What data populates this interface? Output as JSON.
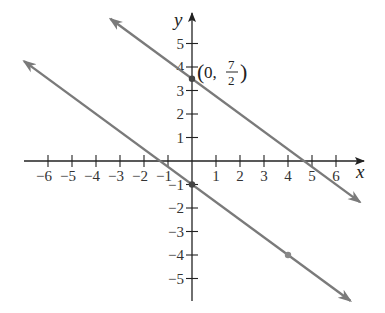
{
  "chart_data": {
    "type": "line",
    "title": "",
    "xlabel": "x",
    "ylabel": "y",
    "xlim": [
      -7,
      7
    ],
    "ylim": [
      -6,
      6
    ],
    "grid": false,
    "x_ticks": [
      -6,
      -5,
      -4,
      -3,
      -2,
      -1,
      1,
      2,
      3,
      4,
      5,
      6
    ],
    "y_ticks": [
      -5,
      -4,
      -3,
      -2,
      -1,
      1,
      2,
      3,
      4,
      5
    ],
    "x_tick_labels": [
      "−6",
      "−5",
      "−4",
      "−3",
      "−2",
      "−1",
      "1",
      "2",
      "3",
      "4",
      "5",
      "6"
    ],
    "y_tick_labels": [
      "−5",
      "−4",
      "−3",
      "−2",
      "−1",
      "1",
      "2",
      "3",
      "4",
      "5"
    ],
    "series": [
      {
        "name": "upper line",
        "equation": "y = -3/4 x + 7/2",
        "slope": -0.75,
        "intercept": 3.5,
        "x": [
          -3.4,
          7.0
        ],
        "y": [
          6.05,
          -1.75
        ],
        "marked_points": [
          [
            0,
            3.5
          ]
        ],
        "color": "#7a7a7a"
      },
      {
        "name": "lower line",
        "equation": "y = -3/4 x - 1",
        "slope": -0.75,
        "intercept": -1,
        "x": [
          -7.0,
          6.6
        ],
        "y": [
          4.25,
          -5.95
        ],
        "marked_points": [
          [
            0,
            -1
          ],
          [
            4,
            -4
          ]
        ],
        "color": "#7a7a7a"
      }
    ],
    "annotations": [
      {
        "text": "(0, 7/2)",
        "x": 0,
        "y": 3.5,
        "numerator": "7",
        "denominator": "2",
        "prefix": "(0,",
        "suffix": ")"
      }
    ]
  }
}
